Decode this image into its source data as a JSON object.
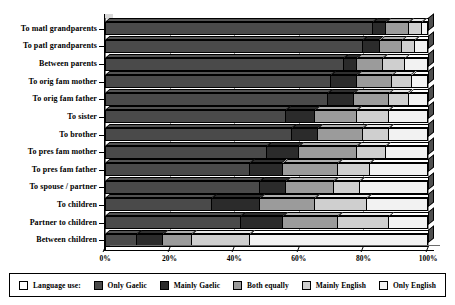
{
  "chart_data": {
    "type": "bar",
    "orientation": "horizontal",
    "stacked": true,
    "normalized": true,
    "title": "",
    "xlabel": "",
    "ylabel": "",
    "xlim": [
      0,
      100
    ],
    "xticks": [
      "0%",
      "20%",
      "40%",
      "60%",
      "80%",
      "100%"
    ],
    "xtick_values": [
      0,
      20,
      40,
      60,
      80,
      100
    ],
    "grid": true,
    "grid_axis": "x",
    "legend_position": "bottom",
    "categories": [
      "To matl grandparents",
      "To patl grandparents",
      "Between parents",
      "To orig fam mother",
      "To orig fam father",
      "To sister",
      "To brother",
      "To pres fam mother",
      "To pres fam father",
      "To spouse / partner",
      "To children",
      "Partner to children",
      "Between children"
    ],
    "series": [
      {
        "name": "Only Gaelic",
        "color": "#4a4a4a",
        "values": [
          83,
          80,
          74,
          70,
          69,
          56,
          58,
          50,
          45,
          48,
          33,
          42,
          10
        ]
      },
      {
        "name": "Mainly Gaelic",
        "color": "#2b2b2b",
        "values": [
          4,
          5,
          4,
          8,
          8,
          9,
          8,
          10,
          10,
          8,
          15,
          13,
          8
        ]
      },
      {
        "name": "Both equally",
        "color": "#9b9b9b",
        "values": [
          7,
          7,
          8,
          11,
          11,
          13,
          14,
          18,
          17,
          15,
          17,
          17,
          9
        ]
      },
      {
        "name": "Mainly English",
        "color": "#cfcfcf",
        "values": [
          4,
          4,
          7,
          6,
          6,
          10,
          8,
          9,
          10,
          8,
          16,
          16,
          18
        ]
      },
      {
        "name": "Only English",
        "color": "#f2f2f2",
        "values": [
          2,
          4,
          7,
          5,
          6,
          12,
          12,
          13,
          18,
          21,
          19,
          12,
          55
        ]
      }
    ],
    "legend": {
      "prefix_label": "Language use:",
      "prefix_swatch_color": "#ffffff",
      "entries": [
        {
          "label": "Only Gaelic",
          "color": "#4a4a4a"
        },
        {
          "label": "Mainly Gaelic",
          "color": "#2b2b2b"
        },
        {
          "label": "Both equally",
          "color": "#9b9b9b"
        },
        {
          "label": "Mainly English",
          "color": "#cfcfcf"
        },
        {
          "label": "Only English",
          "color": "#f2f2f2"
        }
      ]
    }
  }
}
